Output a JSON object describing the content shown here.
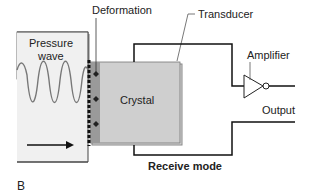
{
  "labels": {
    "deformation": "Deformation",
    "transducer": "Transducer",
    "amplifier": "Amplifier",
    "pressure_wave_1": "Pressure",
    "pressure_wave_2": "wave",
    "crystal": "Crystal",
    "output": "Output",
    "mode": "Receive mode",
    "panel": "B"
  }
}
